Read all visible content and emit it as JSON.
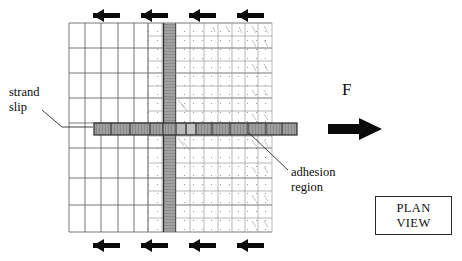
{
  "figure": {
    "view_label_line1": "PLAN",
    "view_label_line2": "VIEW",
    "force_label": "F",
    "callouts": {
      "strand_slip": "strand\nslip",
      "adhesion_region": "adhesion\nregion"
    }
  },
  "colors": {
    "background": "#ffffff",
    "line": "#3a3a3a",
    "mesh_coarse": "#4a4a4a",
    "mesh_fine": "#8d8d8d",
    "strand_fill": "#9a9a9a",
    "strand_edge": "#3c3c3c",
    "arrow": "#0a0a0a",
    "text": "#111111",
    "box_border": "#2a2a2a"
  },
  "mesh": {
    "left": 69,
    "top": 23,
    "right": 272,
    "bottom": 232,
    "coarse_columns": 5,
    "fine_columns": 9,
    "coarse_rows": 6,
    "fine_rows": 7,
    "note": "graded finite element mesh, coarse at left, refined toward right"
  },
  "strand_vertical": {
    "x": 163,
    "width": 13,
    "top": 23,
    "bottom": 232
  },
  "strand_horizontal": {
    "left": 94,
    "right": 297,
    "y": 123,
    "height": 12,
    "segments": 12
  },
  "arrows_top": {
    "direction": "left",
    "count": 4,
    "y": 16,
    "x_positions": [
      83,
      128,
      176,
      224
    ],
    "length": 34
  },
  "arrows_bottom": {
    "direction": "left",
    "count": 4,
    "y": 245,
    "x_positions": [
      83,
      128,
      176,
      224
    ],
    "length": 34
  },
  "force_arrow": {
    "direction": "right",
    "x": 328,
    "y": 129,
    "length": 50
  },
  "leader_strand_slip": {
    "from_x": 42,
    "from_y": 110,
    "to_x": 92,
    "to_y": 128
  },
  "leader_adhesion": {
    "from_x": 288,
    "from_y": 170,
    "to_x": 250,
    "to_y": 134
  }
}
